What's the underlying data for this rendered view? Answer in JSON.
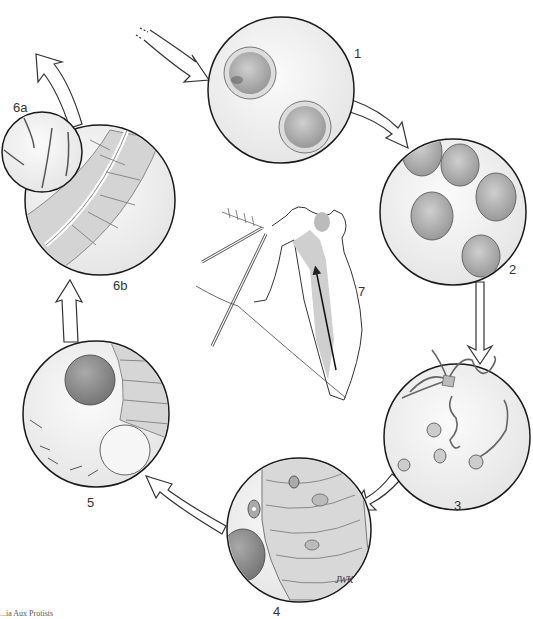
{
  "diagram": {
    "type": "life-cycle",
    "stages": [
      {
        "id": "1",
        "label": "1",
        "content": "two spherical cysts with granular interiors"
      },
      {
        "id": "2",
        "label": "2",
        "content": "five round cells / cysts"
      },
      {
        "id": "3",
        "label": "3",
        "content": "flagellated forms and rounded cells"
      },
      {
        "id": "4",
        "label": "4",
        "content": "epithelial cells with intracellular stages and a large cyst"
      },
      {
        "id": "5",
        "label": "5",
        "content": "two cysts beside epithelial cell layer"
      },
      {
        "id": "6a",
        "label": "6a",
        "content": "small inset with curved elongated forms"
      },
      {
        "id": "6b",
        "label": "6b",
        "content": "gut epithelium with tubular structure"
      },
      {
        "id": "7",
        "label": "7",
        "content": "mosquito head/proboscis diagram with internal anatomy and arrow"
      }
    ],
    "signature": "JWK",
    "caption_fragment": "...ia Aux Protists"
  },
  "colors": {
    "background": "#ffffff",
    "outline": "#1a1a1a",
    "circle_fill": "#f2f2f2",
    "cell_fill": "#b8b8b8",
    "cell_dark": "#8a8a8a",
    "tissue_fill": "#d6d6d6",
    "label": "#333333"
  }
}
